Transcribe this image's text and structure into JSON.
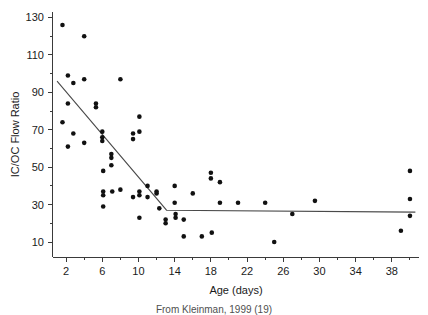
{
  "figure": {
    "caption": "From Kleinman, 1999 (19)"
  },
  "chart_data": {
    "type": "scatter",
    "title": "",
    "xlabel": "Age (days)",
    "ylabel": "IC/OC Flow Ratio",
    "xlim": [
      0,
      41
    ],
    "ylim": [
      2,
      134
    ],
    "grid": false,
    "legend": null,
    "x_major_ticks": [
      2,
      6,
      10,
      14,
      18,
      22,
      26,
      30,
      34,
      38
    ],
    "x_minor_ticks": [
      4,
      8,
      12,
      16,
      20,
      24,
      28,
      32,
      36,
      40
    ],
    "y_major_ticks": [
      10,
      30,
      50,
      70,
      90,
      110,
      130
    ],
    "y_minor_ticks": [
      20,
      40,
      60,
      80,
      100,
      120
    ],
    "marker": {
      "shape": "circle",
      "color": "#111111",
      "radius": 2.3
    },
    "series": [
      {
        "name": "IC/OC flow ratio observations",
        "points": [
          [
            1.6,
            126
          ],
          [
            1.6,
            74
          ],
          [
            2.2,
            99
          ],
          [
            2.2,
            84
          ],
          [
            2.2,
            61
          ],
          [
            2.8,
            95
          ],
          [
            2.8,
            68
          ],
          [
            4.0,
            120
          ],
          [
            4.0,
            97
          ],
          [
            4.0,
            63
          ],
          [
            5.3,
            84
          ],
          [
            5.3,
            82
          ],
          [
            6.0,
            69
          ],
          [
            6.0,
            66
          ],
          [
            6.0,
            64
          ],
          [
            6.1,
            48
          ],
          [
            6.1,
            37
          ],
          [
            6.1,
            35
          ],
          [
            6.1,
            29
          ],
          [
            7.0,
            57
          ],
          [
            7.0,
            55
          ],
          [
            7.0,
            51
          ],
          [
            7.1,
            37
          ],
          [
            8.0,
            97
          ],
          [
            8.0,
            38
          ],
          [
            9.4,
            68
          ],
          [
            9.4,
            65
          ],
          [
            9.4,
            34
          ],
          [
            10.1,
            77
          ],
          [
            10.1,
            69
          ],
          [
            10.1,
            37
          ],
          [
            10.1,
            35
          ],
          [
            10.1,
            23
          ],
          [
            11.0,
            40
          ],
          [
            11.0,
            34
          ],
          [
            12.0,
            37
          ],
          [
            12.0,
            36
          ],
          [
            12.3,
            28
          ],
          [
            13.0,
            22
          ],
          [
            13.0,
            20
          ],
          [
            14.0,
            40
          ],
          [
            14.0,
            31
          ],
          [
            14.1,
            25
          ],
          [
            14.1,
            23
          ],
          [
            15.0,
            22
          ],
          [
            15.0,
            13
          ],
          [
            16.0,
            36
          ],
          [
            17.0,
            13
          ],
          [
            18.0,
            47
          ],
          [
            18.0,
            44
          ],
          [
            18.1,
            15
          ],
          [
            19.0,
            42
          ],
          [
            19.0,
            31
          ],
          [
            21.0,
            31
          ],
          [
            24.0,
            31
          ],
          [
            25.0,
            10
          ],
          [
            27.0,
            25
          ],
          [
            29.5,
            32
          ],
          [
            39.0,
            16
          ],
          [
            40.0,
            48
          ],
          [
            40.0,
            33
          ],
          [
            40.0,
            24
          ]
        ]
      }
    ],
    "fit": {
      "name": "piecewise regression",
      "type": "piecewise-linear",
      "color": "#4a4a4a",
      "breakpoint_x": 13.1,
      "plateau_y": 27,
      "vertices": [
        [
          1.0,
          96
        ],
        [
          13.1,
          27
        ],
        [
          40.6,
          26
        ]
      ]
    }
  }
}
